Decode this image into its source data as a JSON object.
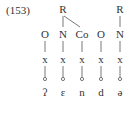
{
  "example_number": "(153)",
  "rhyme_nodes": [
    "R",
    "R"
  ],
  "constituents": [
    "O",
    "N",
    "Co",
    "O",
    "N"
  ],
  "skeleton": [
    "x",
    "x",
    "x",
    "x",
    "x"
  ],
  "segments": [
    "ʔ",
    "ɛ",
    "n",
    "d",
    "ə"
  ]
}
